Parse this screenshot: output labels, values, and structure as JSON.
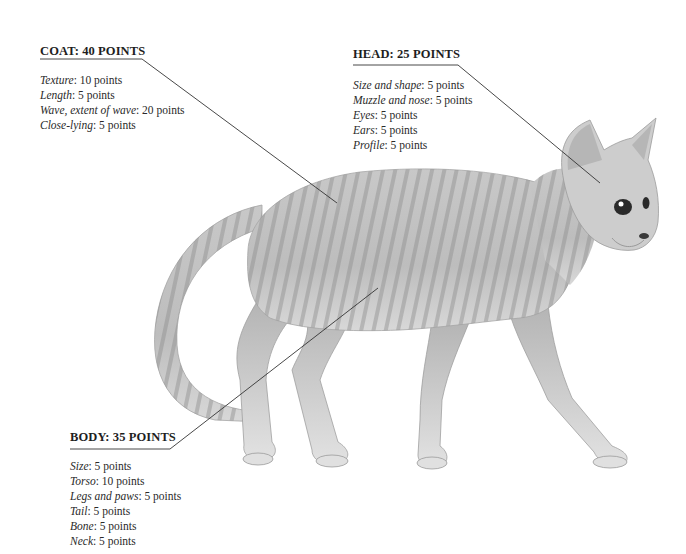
{
  "coat": {
    "heading": "COAT: 40 POINTS",
    "items": [
      {
        "label": "Texture",
        "value": ": 10 points"
      },
      {
        "label": "Length",
        "value": ": 5 points"
      },
      {
        "label": "Wave, extent of wave",
        "value": ": 20 points"
      },
      {
        "label": "Close-lying",
        "value": ": 5 points"
      }
    ]
  },
  "head": {
    "heading": "HEAD: 25 POINTS",
    "items": [
      {
        "label": "Size and shape",
        "value": ": 5 points"
      },
      {
        "label": "Muzzle and nose",
        "value": ": 5 points"
      },
      {
        "label": "Eyes",
        "value": ": 5 points"
      },
      {
        "label": "Ears",
        "value": ": 5 points"
      },
      {
        "label": "Profile",
        "value": ": 5 points"
      }
    ]
  },
  "body": {
    "heading": "BODY: 35 POINTS",
    "items": [
      {
        "label": "Size",
        "value": ": 5 points"
      },
      {
        "label": "Torso",
        "value": ": 10 points"
      },
      {
        "label": "Legs and paws",
        "value": ": 5 points"
      },
      {
        "label": "Tail",
        "value": ": 5 points"
      },
      {
        "label": "Bone",
        "value": ": 5 points"
      },
      {
        "label": "Neck",
        "value": ": 5 points"
      }
    ]
  },
  "illustration": {
    "subject": "curly-coated tabby cat, side view facing right",
    "colors": {
      "fur_light": "#d6d6d6",
      "fur_mid": "#b0b0b0",
      "fur_dark": "#8a8a8a",
      "leader_line": "#333333"
    }
  }
}
